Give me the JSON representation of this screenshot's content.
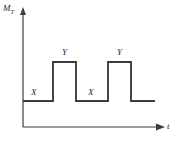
{
  "figure": {
    "background_color": "#ffffff",
    "line_color": "#3d3d3d",
    "text_color": "#1f1f1f",
    "caption": ""
  },
  "axes": {
    "y_label_main": "M",
    "y_label_sub": "T",
    "x_label": "t",
    "y_arrow_icon": "arrow-up-icon",
    "x_arrow_icon": "arrow-right-icon"
  },
  "annotations": [
    {
      "id": "X1",
      "text": "X",
      "x_px": 31,
      "y_px": 88
    },
    {
      "id": "Y1",
      "text": "Y",
      "x_px": 62,
      "y_px": 48
    },
    {
      "id": "X2",
      "text": "X",
      "x_px": 88,
      "y_px": 88
    },
    {
      "id": "Y2",
      "text": "Y",
      "x_px": 117,
      "y_px": 48
    }
  ],
  "chart_data": {
    "type": "line",
    "title": "",
    "subtitle": "",
    "xlabel": "t",
    "ylabel": "M_T",
    "grid": false,
    "legend": false,
    "legend_position": "none",
    "axis_arrows": true,
    "xlim": [
      0,
      178
    ],
    "ylim": [
      0,
      147
    ],
    "levels": {
      "low_label": "X",
      "high_label": "Y",
      "low_y_px": 101,
      "high_y_px": 62,
      "baseline_y_px": 127
    },
    "series": [
      {
        "name": "M_T(t)",
        "style": "step",
        "color": "#3d3d3d",
        "points_px": [
          {
            "x": 23,
            "y": 101
          },
          {
            "x": 53,
            "y": 101
          },
          {
            "x": 53,
            "y": 62
          },
          {
            "x": 76,
            "y": 62
          },
          {
            "x": 76,
            "y": 101
          },
          {
            "x": 108,
            "y": 101
          },
          {
            "x": 108,
            "y": 62
          },
          {
            "x": 131,
            "y": 62
          },
          {
            "x": 131,
            "y": 101
          },
          {
            "x": 155,
            "y": 101
          }
        ],
        "segments": [
          {
            "label": "X",
            "level": "low",
            "x_start_px": 23,
            "x_end_px": 53
          },
          {
            "label": "Y",
            "level": "high",
            "x_start_px": 53,
            "x_end_px": 76
          },
          {
            "label": "X",
            "level": "low",
            "x_start_px": 76,
            "x_end_px": 108
          },
          {
            "label": "Y",
            "level": "high",
            "x_start_px": 108,
            "x_end_px": 131
          },
          {
            "label": "",
            "level": "low",
            "x_start_px": 131,
            "x_end_px": 155
          }
        ]
      }
    ]
  }
}
